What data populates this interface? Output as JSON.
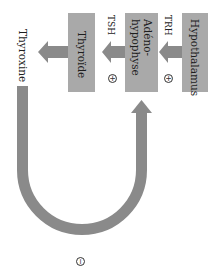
{
  "diagram": {
    "orientation": "rotated-90-clockwise",
    "colors": {
      "box_fill": "#a9a9a9",
      "arrow_fill": "#8a8a8a",
      "background": "#ffffff"
    },
    "nodes": [
      {
        "id": "hypothalamus",
        "label": "Hypothalamus"
      },
      {
        "id": "adenohypophyse",
        "label": "Adéno-\nhypophyse",
        "label_line1": "Adéno-",
        "label_line2": "hypophyse"
      },
      {
        "id": "thyroide",
        "label": "Thyroïde"
      },
      {
        "id": "thyroxine",
        "label": "Thyroxine"
      }
    ],
    "edges": [
      {
        "from": "hypothalamus",
        "to": "adenohypophyse",
        "hormone": "TRH",
        "effect": "+"
      },
      {
        "from": "adenohypophyse",
        "to": "thyroide",
        "hormone": "TSH",
        "effect": "+"
      },
      {
        "from": "thyroide",
        "to": "thyroxine",
        "hormone": "",
        "effect": ""
      },
      {
        "from": "thyroxine",
        "to": "adenohypophyse",
        "hormone": "",
        "effect": "−",
        "type": "negative-feedback"
      }
    ],
    "labels": {
      "trh": "TRH",
      "tsh": "TSH",
      "plus1": "+",
      "plus2": "+",
      "minus": "−"
    }
  }
}
